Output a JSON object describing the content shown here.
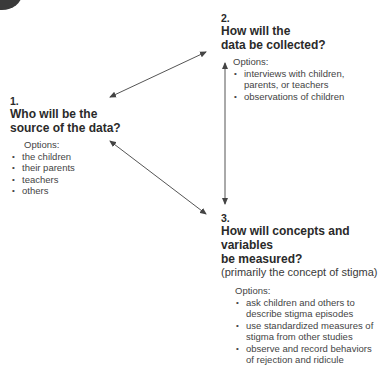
{
  "nodes": [
    {
      "number": "1.",
      "question_lines": [
        "Who will be the",
        "source of the data?"
      ],
      "subtitle": "",
      "options_label": "Options:",
      "options": [
        "the children",
        "their parents",
        "teachers",
        "others"
      ]
    },
    {
      "number": "2.",
      "question_lines": [
        "How will the",
        "data be collected?"
      ],
      "subtitle": "",
      "options_label": "Options:",
      "options": [
        "interviews with children,\nparents, or teachers",
        "observations of children"
      ]
    },
    {
      "number": "3.",
      "question_lines": [
        "How will concepts and variables",
        "be measured?"
      ],
      "subtitle": "(primarily the concept of stigma)",
      "options_label": "Options:",
      "options": [
        "ask children and others to describe stigma episodes",
        "use standardized measures of stigma from other studies",
        "observe and record behaviors of rejection and ridicule"
      ]
    }
  ],
  "edges": [
    {
      "from": "2",
      "to": "1",
      "style": "double-arrow"
    },
    {
      "from": "2",
      "to": "3",
      "style": "double-arrow"
    },
    {
      "from": "1",
      "to": "3",
      "style": "double-arrow"
    }
  ],
  "colors": {
    "text": "#2a2a2a",
    "arrow": "#555555",
    "background": "#ffffff"
  }
}
